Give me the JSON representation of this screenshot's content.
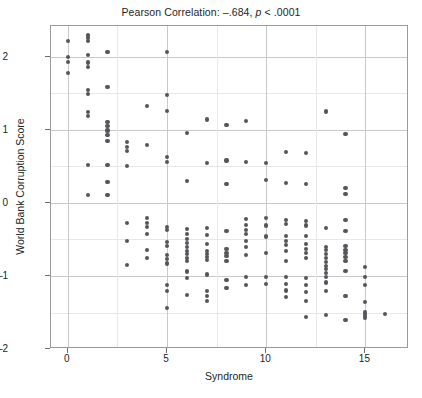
{
  "chart_data": {
    "type": "scatter",
    "title": "Pearson Correlation: –.684, p < .0001",
    "title_prefix": "Pearson Correlation: –.684, ",
    "title_italic": "p",
    "title_suffix": " < .0001",
    "xlabel": "Syndrome",
    "ylabel": "World Bank Corruption Score",
    "xlim": [
      -0.85,
      17.2
    ],
    "ylim": [
      -2.0,
      2.42
    ],
    "xticks": [
      0,
      5,
      10,
      15
    ],
    "xtick_labels": [
      "0",
      "5",
      "10",
      "15"
    ],
    "yticks": [
      -2,
      -1,
      0,
      1,
      2
    ],
    "ytick_labels": [
      "–2",
      "–1",
      "0",
      "1",
      "2"
    ],
    "grid": true,
    "grid_major_color": "#c9c9c9",
    "grid_minor_color": "#e8e8e8",
    "marker_color": "#55555b",
    "marker_size_px": 4.2,
    "frame_color": "#9a9a9a",
    "background": "#ffffff",
    "legend": null,
    "annotations": [],
    "pearson_r": -0.684,
    "p_value": "< .0001",
    "n_points": 186,
    "points": [
      [
        0,
        2.21
      ],
      [
        0,
        1.99
      ],
      [
        0,
        1.93
      ],
      [
        0,
        1.78
      ],
      [
        1,
        2.29
      ],
      [
        1,
        2.25
      ],
      [
        1,
        2.22
      ],
      [
        1,
        2.02
      ],
      [
        1,
        1.92
      ],
      [
        1,
        1.86
      ],
      [
        1,
        1.55
      ],
      [
        1,
        1.49
      ],
      [
        1,
        1.24
      ],
      [
        1,
        1.19
      ],
      [
        1,
        0.52
      ],
      [
        1,
        0.11
      ],
      [
        2,
        2.07
      ],
      [
        2,
        1.59
      ],
      [
        2,
        1.11
      ],
      [
        2,
        1.05
      ],
      [
        2,
        0.99
      ],
      [
        2,
        0.93
      ],
      [
        2,
        0.85
      ],
      [
        2,
        0.52
      ],
      [
        2,
        0.29
      ],
      [
        2,
        0.11
      ],
      [
        3,
        0.83
      ],
      [
        3,
        0.77
      ],
      [
        3,
        0.71
      ],
      [
        3,
        0.5
      ],
      [
        3,
        -0.27
      ],
      [
        3,
        -0.52
      ],
      [
        3,
        -0.85
      ],
      [
        4,
        1.33
      ],
      [
        4,
        0.79
      ],
      [
        4,
        -0.21
      ],
      [
        4,
        -0.27
      ],
      [
        4,
        -0.33
      ],
      [
        4,
        -0.43
      ],
      [
        4,
        -0.64
      ],
      [
        4,
        -0.75
      ],
      [
        5,
        2.07
      ],
      [
        5,
        1.47
      ],
      [
        5,
        1.26
      ],
      [
        5,
        0.63
      ],
      [
        5,
        0.56
      ],
      [
        5,
        -0.33
      ],
      [
        5,
        -0.37
      ],
      [
        5,
        -0.53
      ],
      [
        5,
        -0.59
      ],
      [
        5,
        -0.71
      ],
      [
        5,
        -0.77
      ],
      [
        5,
        -0.83
      ],
      [
        5,
        -1.12
      ],
      [
        5,
        -1.21
      ],
      [
        5,
        -1.44
      ],
      [
        6,
        0.96
      ],
      [
        6,
        0.3
      ],
      [
        6,
        -0.36
      ],
      [
        6,
        -0.43
      ],
      [
        6,
        -0.49
      ],
      [
        6,
        -0.55
      ],
      [
        6,
        -0.61
      ],
      [
        6,
        -0.66
      ],
      [
        6,
        -0.7
      ],
      [
        6,
        -0.75
      ],
      [
        6,
        -0.8
      ],
      [
        6,
        -0.94
      ],
      [
        6,
        -1.03
      ],
      [
        6,
        -1.26
      ],
      [
        7,
        1.14
      ],
      [
        7,
        0.54
      ],
      [
        7,
        -0.34
      ],
      [
        7,
        -0.44
      ],
      [
        7,
        -0.56
      ],
      [
        7,
        -0.66
      ],
      [
        7,
        -0.7
      ],
      [
        7,
        -0.74
      ],
      [
        7,
        -0.78
      ],
      [
        7,
        -0.98
      ],
      [
        7,
        -1.21
      ],
      [
        7,
        -1.28
      ],
      [
        7,
        -1.34
      ],
      [
        8,
        1.07
      ],
      [
        8,
        0.58
      ],
      [
        8,
        0.26
      ],
      [
        8,
        -0.38
      ],
      [
        8,
        -0.63
      ],
      [
        8,
        -0.69
      ],
      [
        8,
        -0.73
      ],
      [
        8,
        -0.79
      ],
      [
        8,
        -1.05
      ],
      [
        8,
        -1.16
      ],
      [
        9,
        1.12
      ],
      [
        9,
        0.56
      ],
      [
        9,
        -0.22
      ],
      [
        9,
        -0.3
      ],
      [
        9,
        -0.37
      ],
      [
        9,
        -0.43
      ],
      [
        9,
        -0.52
      ],
      [
        9,
        -0.6
      ],
      [
        9,
        -0.71
      ],
      [
        9,
        -1.02
      ],
      [
        9,
        -1.13
      ],
      [
        10,
        0.55
      ],
      [
        10,
        0.31
      ],
      [
        10,
        -0.21
      ],
      [
        10,
        -0.31
      ],
      [
        10,
        -0.46
      ],
      [
        10,
        -0.69
      ],
      [
        10,
        -1.02
      ],
      [
        10,
        -1.11
      ],
      [
        11,
        0.69
      ],
      [
        11,
        0.27
      ],
      [
        11,
        -0.23
      ],
      [
        11,
        -0.29
      ],
      [
        11,
        -0.45
      ],
      [
        11,
        -0.52
      ],
      [
        11,
        -0.58
      ],
      [
        11,
        -0.66
      ],
      [
        11,
        -0.79
      ],
      [
        11,
        -1.02
      ],
      [
        11,
        -1.11
      ],
      [
        11,
        -1.2
      ],
      [
        11,
        -1.29
      ],
      [
        12,
        0.68
      ],
      [
        12,
        0.26
      ],
      [
        12,
        -0.25
      ],
      [
        12,
        -0.31
      ],
      [
        12,
        -0.45
      ],
      [
        12,
        -0.56
      ],
      [
        12,
        -0.63
      ],
      [
        12,
        -0.69
      ],
      [
        12,
        -0.76
      ],
      [
        12,
        -1.03
      ],
      [
        12,
        -1.13
      ],
      [
        12,
        -1.22
      ],
      [
        12,
        -1.34
      ],
      [
        12,
        -1.56
      ],
      [
        13,
        1.25
      ],
      [
        13,
        -0.34
      ],
      [
        13,
        -0.6
      ],
      [
        13,
        -0.65
      ],
      [
        13,
        -0.7
      ],
      [
        13,
        -0.76
      ],
      [
        13,
        -0.81
      ],
      [
        13,
        -0.86
      ],
      [
        13,
        -0.91
      ],
      [
        13,
        -0.96
      ],
      [
        13,
        -1.02
      ],
      [
        13,
        -1.09
      ],
      [
        13,
        -1.21
      ],
      [
        13,
        -1.53
      ],
      [
        14,
        0.94
      ],
      [
        14,
        0.2
      ],
      [
        14,
        0.12
      ],
      [
        14,
        -0.24
      ],
      [
        14,
        -0.39
      ],
      [
        14,
        -0.59
      ],
      [
        14,
        -0.64
      ],
      [
        14,
        -0.69
      ],
      [
        14,
        -0.74
      ],
      [
        14,
        -0.79
      ],
      [
        14,
        -0.93
      ],
      [
        14,
        -1.28
      ],
      [
        14,
        -1.6
      ],
      [
        15,
        -1.01
      ],
      [
        15,
        -1.13
      ],
      [
        15,
        -1.36
      ],
      [
        15,
        -1.49
      ],
      [
        15,
        -1.52
      ],
      [
        15,
        -1.55
      ],
      [
        15,
        -1.58
      ],
      [
        15,
        -0.88
      ],
      [
        16,
        -1.52
      ]
    ]
  }
}
